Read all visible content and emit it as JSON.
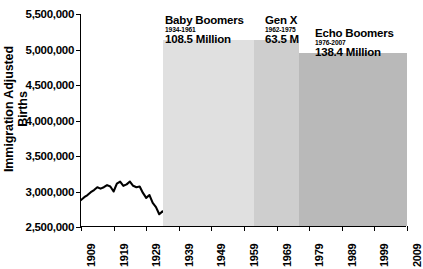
{
  "chart_data": {
    "type": "line",
    "title": "",
    "xlabel": "",
    "ylabel": "Immigration Adjusted Births",
    "xlim": [
      1909,
      2009
    ],
    "ylim": [
      2500000,
      5500000
    ],
    "grid": false,
    "legend": "none",
    "yticks": [
      "5,500,000",
      "5,000,000",
      "4,500,000",
      "4,000,000",
      "3,500,000",
      "3,000,000",
      "2,500,000"
    ],
    "ytick_values": [
      5500000,
      5000000,
      4500000,
      4000000,
      3500000,
      3000000,
      2500000
    ],
    "xticks": [
      "1909",
      "1919",
      "1929",
      "1939",
      "1949",
      "1959",
      "1969",
      "1979",
      "1989",
      "1999",
      "2009"
    ],
    "xtick_values": [
      1909,
      1919,
      1929,
      1939,
      1949,
      1959,
      1969,
      1979,
      1989,
      1999,
      2009
    ],
    "series": [
      {
        "name": "Immigration Adjusted Births",
        "color": "#000000",
        "x": [
          1909,
          1910,
          1911,
          1912,
          1913,
          1914,
          1915,
          1916,
          1917,
          1918,
          1919,
          1920,
          1921,
          1922,
          1923,
          1924,
          1925,
          1926,
          1927,
          1928,
          1929,
          1930,
          1931,
          1932,
          1933,
          1934,
          1935,
          1936,
          1937,
          1938,
          1939,
          1940,
          1941,
          1942,
          1943,
          1944,
          1945,
          1946,
          1947,
          1948,
          1949,
          1950,
          1951,
          1952,
          1953,
          1954,
          1955,
          1956,
          1957,
          1958,
          1959,
          1960,
          1961,
          1962,
          1963,
          1964,
          1965,
          1966,
          1967,
          1968,
          1969,
          1970,
          1971,
          1972,
          1973,
          1974,
          1975,
          1976,
          1977,
          1978,
          1979,
          1980,
          1981,
          1982,
          1983,
          1984,
          1985,
          1986,
          1987,
          1988,
          1989,
          1990,
          1991,
          1992,
          1993,
          1994,
          1995,
          1996,
          1997,
          1998,
          1999,
          2000,
          2001,
          2002,
          2003,
          2004,
          2005,
          2006,
          2007,
          2008,
          2009
        ],
        "y": [
          2880000,
          2920000,
          2950000,
          2990000,
          3020000,
          3060000,
          3040000,
          3060000,
          3090000,
          3070000,
          3000000,
          3110000,
          3140000,
          3080000,
          3100000,
          3140000,
          3080000,
          3060000,
          3070000,
          2980000,
          2910000,
          2950000,
          2840000,
          2780000,
          2680000,
          2720000,
          2690000,
          2650000,
          2700000,
          2760000,
          2750000,
          2790000,
          2890000,
          3080000,
          3160000,
          3030000,
          2990000,
          3310000,
          3610000,
          3520000,
          3580000,
          3630000,
          3750000,
          3840000,
          3900000,
          4020000,
          4090000,
          4210000,
          4300000,
          4250000,
          4290000,
          4260000,
          4270000,
          4170000,
          4100000,
          4030000,
          3760000,
          3610000,
          3520000,
          3500000,
          3600000,
          3730000,
          3560000,
          3260000,
          3140000,
          3160000,
          3140000,
          3170000,
          3330000,
          3340000,
          3490000,
          3610000,
          3630000,
          3680000,
          3640000,
          3670000,
          3760000,
          3760000,
          3810000,
          3910000,
          4040000,
          4160000,
          4110000,
          4070000,
          4000000,
          3950000,
          3900000,
          3890000,
          3880000,
          3940000,
          3960000,
          4060000,
          4030000,
          4020000,
          4090000,
          4110000,
          4140000,
          4270000,
          4320000,
          4250000,
          4130000
        ]
      }
    ],
    "annotations": [
      {
        "name": "baby-boomers",
        "title": "Baby Boomers",
        "years": "1934-1961",
        "count": "108.5 Million",
        "range": [
          1934,
          1961
        ],
        "band_color": "#e0e0e0"
      },
      {
        "name": "gen-x",
        "title": "Gen X",
        "years": "1962-1975",
        "count": "63.5 M",
        "range": [
          1962,
          1975
        ],
        "band_color": "#cecece"
      },
      {
        "name": "echo-boomers",
        "title": "Echo Boomers",
        "years": "1976-2007",
        "count": "138.4 Million",
        "range": [
          1976,
          2007
        ],
        "band_color": "#b9b9b9"
      }
    ]
  }
}
